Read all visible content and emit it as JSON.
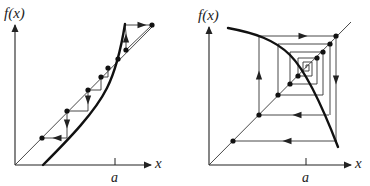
{
  "figure": {
    "panels": [
      {
        "id": "left",
        "description": "Cobweb diagram: iteration diverging from fixed point at x=a (steep increasing f)",
        "y_label": "f(x)",
        "x_label": "x",
        "tick_label": "a",
        "origin": [
          15,
          165
        ],
        "y_axis_top": [
          15,
          25
        ],
        "x_axis_end": [
          151,
          165
        ],
        "tick_x": 115,
        "diagonal": [
          [
            15,
            165
          ],
          [
            153,
            26
          ]
        ],
        "curve": "M43,165 C70,138 95,112 107,88 C115,72 120,55 125,24",
        "cobweb_path": "M42,138 L67,138 L67,111 L88,111 L88,90 L101,90 L101,77 L108,77 L108,68 M126,50 L126,33 L125,25 L152,25 L126,50",
        "dots": [
          [
            42,
            138
          ],
          [
            67,
            111
          ],
          [
            88,
            90
          ],
          [
            101,
            77
          ],
          [
            108,
            68
          ],
          [
            118,
            59
          ],
          [
            126,
            50
          ],
          [
            152,
            25
          ]
        ],
        "arrows": [
          {
            "at": [
              57,
              138
            ],
            "dir": "left"
          },
          {
            "at": [
              67,
              124
            ],
            "dir": "down"
          },
          {
            "at": [
              88,
              100
            ],
            "dir": "down"
          },
          {
            "at": [
              126,
              38
            ],
            "dir": "up"
          },
          {
            "at": [
              142,
              25
            ],
            "dir": "right"
          }
        ]
      },
      {
        "id": "right",
        "description": "Cobweb diagram: iteration spiraling into stable fixed point (decreasing f)",
        "y_label": "f(x)",
        "x_label": "x",
        "tick_label": "a",
        "origin": [
          209,
          165
        ],
        "y_axis_top": [
          209,
          27
        ],
        "x_axis_end": [
          351,
          165
        ],
        "tick_x": 306,
        "diagonal": [
          [
            209,
            165
          ],
          [
            351,
            22
          ]
        ],
        "curve": "M228,28 C255,33 275,40 290,55 C305,70 320,100 338,147",
        "cobweb_path": "M233,141 L337,141 L337,141 M259,115 L329,115 M336,36 L336,141 M259,115 L259,36 L336,36 M278,95 L278,44 L330,44 L330,115 M290,84 L290,52 L323,52 L323,95 L278,95 M298,76 L298,58 L317,58 L317,84 L290,84 M303,71 L303,62 L312,62 L312,76 L298,76 M306,68 L306,65 L309,65 L309,71 L303,71",
        "dots": [
          [
            233,
            141
          ],
          [
            259,
            115
          ],
          [
            278,
            95
          ],
          [
            290,
            84
          ],
          [
            298,
            76
          ],
          [
            336,
            36
          ],
          [
            330,
            44
          ],
          [
            323,
            52
          ],
          [
            317,
            58
          ]
        ],
        "arrows": [
          {
            "at": [
              287,
              141
            ],
            "dir": "left"
          },
          {
            "at": [
              297,
              115
            ],
            "dir": "left"
          },
          {
            "at": [
              259,
              75
            ],
            "dir": "up"
          },
          {
            "at": [
              303,
              36
            ],
            "dir": "right"
          },
          {
            "at": [
              336,
              80
            ],
            "dir": "down"
          }
        ]
      }
    ]
  }
}
